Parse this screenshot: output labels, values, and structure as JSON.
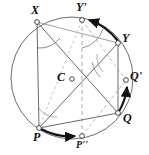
{
  "figure": {
    "kind": "geometry-diagram",
    "canvas": {
      "width": 149,
      "height": 155
    },
    "colors": {
      "circle_stroke": "#6b6b6b",
      "solid_line": "#555555",
      "dashed_line": "#9a9a9a",
      "arrow": "#111111",
      "label_text": "#111111",
      "point_fill": "#ffffff",
      "point_stroke": "#333333",
      "background": "#ffffff"
    },
    "circle": {
      "cx": 72,
      "cy": 78,
      "r": 61
    },
    "center_point": {
      "cx": 72,
      "cy": 79,
      "r": 2.3
    },
    "points": [
      {
        "id": "X",
        "label": "X",
        "x": 37,
        "y": 22,
        "label_x": 31,
        "label_y": 6,
        "marker": true
      },
      {
        "id": "Yp",
        "label": "Y'",
        "x": 82,
        "y": 20,
        "label_x": 76,
        "label_y": 3,
        "marker": true
      },
      {
        "id": "Y",
        "label": "Y",
        "x": 118,
        "y": 43,
        "label_x": 123,
        "label_y": 33,
        "marker": true
      },
      {
        "id": "Qp",
        "label": "Q'",
        "x": 126,
        "y": 80,
        "label_x": 131,
        "label_y": 71,
        "marker": true
      },
      {
        "id": "Q",
        "label": "Q",
        "x": 118,
        "y": 113,
        "label_x": 124,
        "label_y": 112,
        "marker": true
      },
      {
        "id": "Pp",
        "label": "P''",
        "x": 82,
        "y": 136,
        "label_x": 77,
        "label_y": 140,
        "marker": true
      },
      {
        "id": "P",
        "label": "P",
        "x": 39,
        "y": 128,
        "label_x": 33,
        "label_y": 132,
        "marker": true
      },
      {
        "id": "C",
        "label": "C",
        "x": 72,
        "y": 79,
        "label_x": 57,
        "label_y": 71,
        "marker": false
      }
    ],
    "solid_segments": [
      {
        "name": "segment-X-P",
        "x1": 37,
        "y1": 22,
        "x2": 39,
        "y2": 128
      },
      {
        "name": "segment-Y-Q",
        "x1": 118,
        "y1": 43,
        "x2": 118,
        "y2": 113
      },
      {
        "name": "segment-X-Q",
        "x1": 37,
        "y1": 22,
        "x2": 118,
        "y2": 113
      },
      {
        "name": "segment-Y-P",
        "x1": 118,
        "y1": 43,
        "x2": 39,
        "y2": 128
      },
      {
        "name": "segment-P-Q",
        "x1": 39,
        "y1": 128,
        "x2": 118,
        "y2": 113
      },
      {
        "name": "segment-X-Y",
        "x1": 37,
        "y1": 22,
        "x2": 118,
        "y2": 43
      }
    ],
    "dashed_segments": [
      {
        "name": "segment-Yp-Pp",
        "x1": 82,
        "y1": 20,
        "x2": 82,
        "y2": 136
      },
      {
        "name": "segment-Yp-Qp",
        "x1": 82,
        "y1": 20,
        "x2": 126,
        "y2": 80
      },
      {
        "name": "segment-Pp-Qp",
        "x1": 82,
        "y1": 136,
        "x2": 126,
        "y2": 80
      },
      {
        "name": "segment-Yp-P",
        "x1": 82,
        "y1": 20,
        "x2": 39,
        "y2": 128
      }
    ],
    "rotation_arrows": [
      {
        "name": "arrow-Y-to-Yp",
        "from": "Y",
        "to": "Y'"
      },
      {
        "name": "arrow-Q-to-Qp",
        "from": "Q",
        "to": "Q'"
      },
      {
        "name": "arrow-P-to-Pp",
        "from": "P",
        "to": "P''"
      }
    ],
    "angle_marks": [
      {
        "name": "angle-at-X",
        "vertex": "X"
      },
      {
        "name": "angle-at-Yp",
        "vertex": "Y'"
      },
      {
        "name": "angle-at-Y",
        "vertex": "Y"
      },
      {
        "name": "angle-at-P",
        "vertex": "P"
      }
    ]
  }
}
